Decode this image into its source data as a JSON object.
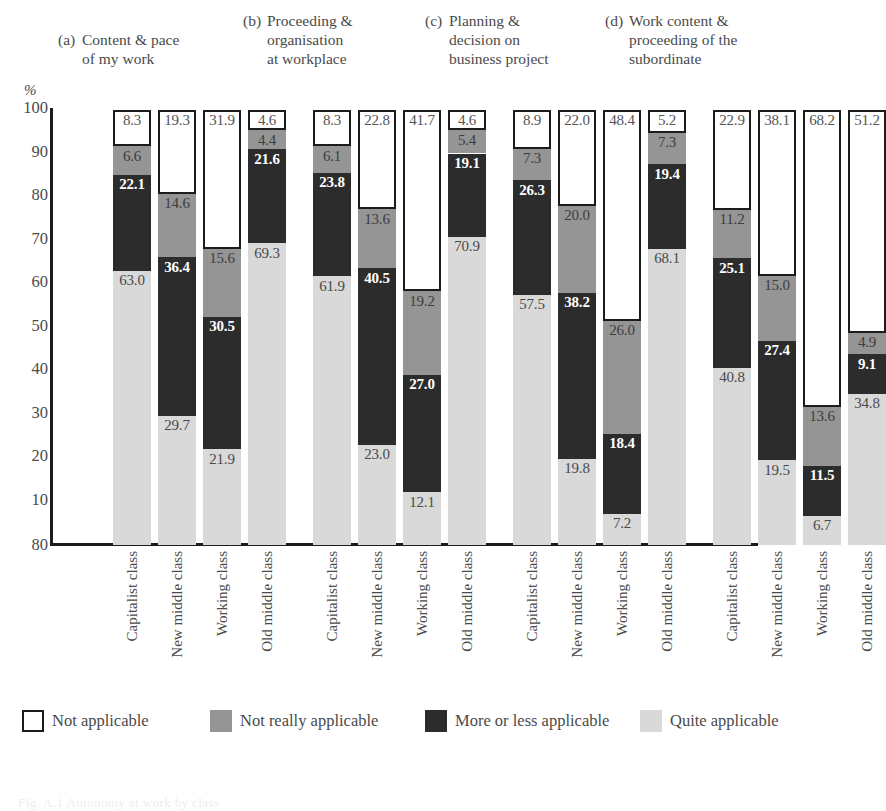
{
  "axis": {
    "unit_label": "%",
    "yticks": [
      "100",
      "90",
      "80",
      "70",
      "60",
      "50",
      "40",
      "30",
      "20",
      "10",
      "80"
    ]
  },
  "captions": [
    {
      "tag": "(a)",
      "text": "Content & pace\nof my work"
    },
    {
      "tag": "(b)",
      "text": "Proceeding &\norganisation\nat workplace"
    },
    {
      "tag": "(c)",
      "text": "Planning &\ndecision on\nbusiness project"
    },
    {
      "tag": "(d)",
      "text": "Work content &\nproceeding of the\nsubordinate"
    }
  ],
  "categories": [
    "Capitalist class",
    "New middle class",
    "Working class",
    "Old middle class"
  ],
  "legend": [
    {
      "label": "Not applicable",
      "color": "#ffffff",
      "key": "not_applicable"
    },
    {
      "label": "Not really applicable",
      "color": "#959595",
      "key": "not_really_applicable"
    },
    {
      "label": "More or less applicable",
      "color": "#2c2c2c",
      "key": "more_or_less_applicable"
    },
    {
      "label": "Quite applicable",
      "color": "#d9d9d9",
      "key": "quite_applicable"
    }
  ],
  "footer_clipped": "Fig. A.1  Autonomy at work by class",
  "chart_data": {
    "type": "bar",
    "subtype": "stacked-100-percent",
    "title": "",
    "xlabel": "",
    "ylabel": "%",
    "ylim": [
      0,
      100
    ],
    "grid": false,
    "legend_position": "bottom",
    "categories": [
      "Capitalist class",
      "New middle class",
      "Working class",
      "Old middle class"
    ],
    "series": [
      {
        "name": "Quite applicable",
        "color": "#d9d9d9"
      },
      {
        "name": "More or less applicable",
        "color": "#2c2c2c"
      },
      {
        "name": "Not really applicable",
        "color": "#959595"
      },
      {
        "name": "Not applicable",
        "color": "#ffffff"
      }
    ],
    "panels": [
      {
        "tag": "(a)",
        "title": "Content & pace of my work",
        "bars": [
          {
            "category": "Capitalist class",
            "quite_applicable": 63.0,
            "more_or_less_applicable": 22.1,
            "not_really_applicable": 6.6,
            "not_applicable": 8.3
          },
          {
            "category": "New middle class",
            "quite_applicable": 29.7,
            "more_or_less_applicable": 36.4,
            "not_really_applicable": 14.6,
            "not_applicable": 19.3
          },
          {
            "category": "Working class",
            "quite_applicable": 21.9,
            "more_or_less_applicable": 30.5,
            "not_really_applicable": 15.6,
            "not_applicable": 31.9
          },
          {
            "category": "Old middle class",
            "quite_applicable": 69.3,
            "more_or_less_applicable": 21.6,
            "not_really_applicable": 4.4,
            "not_applicable": 4.6
          }
        ]
      },
      {
        "tag": "(b)",
        "title": "Proceeding & organisation at workplace",
        "bars": [
          {
            "category": "Capitalist class",
            "quite_applicable": 61.9,
            "more_or_less_applicable": 23.8,
            "not_really_applicable": 6.1,
            "not_applicable": 8.3
          },
          {
            "category": "New middle class",
            "quite_applicable": 23.0,
            "more_or_less_applicable": 40.5,
            "not_really_applicable": 13.6,
            "not_applicable": 22.8
          },
          {
            "category": "Working class",
            "quite_applicable": 12.1,
            "more_or_less_applicable": 27.0,
            "not_really_applicable": 19.2,
            "not_applicable": 41.7
          },
          {
            "category": "Old middle class",
            "quite_applicable": 70.9,
            "more_or_less_applicable": 19.1,
            "not_really_applicable": 5.4,
            "not_applicable": 4.6
          }
        ]
      },
      {
        "tag": "(c)",
        "title": "Planning & decision on business project",
        "bars": [
          {
            "category": "Capitalist class",
            "quite_applicable": 57.5,
            "more_or_less_applicable": 26.3,
            "not_really_applicable": 7.3,
            "not_applicable": 8.9
          },
          {
            "category": "New middle class",
            "quite_applicable": 19.8,
            "more_or_less_applicable": 38.2,
            "not_really_applicable": 20.0,
            "not_applicable": 22.0
          },
          {
            "category": "Working class",
            "quite_applicable": 7.2,
            "more_or_less_applicable": 18.4,
            "not_really_applicable": 26.0,
            "not_applicable": 48.4
          },
          {
            "category": "Old middle class",
            "quite_applicable": 68.1,
            "more_or_less_applicable": 19.4,
            "not_really_applicable": 7.3,
            "not_applicable": 5.2
          }
        ]
      },
      {
        "tag": "(d)",
        "title": "Work content & proceeding of the subordinate",
        "bars": [
          {
            "category": "Capitalist class",
            "quite_applicable": 40.8,
            "more_or_less_applicable": 25.1,
            "not_really_applicable": 11.2,
            "not_applicable": 22.9
          },
          {
            "category": "New middle class",
            "quite_applicable": 19.5,
            "more_or_less_applicable": 27.4,
            "not_really_applicable": 15.0,
            "not_applicable": 38.1
          },
          {
            "category": "Working class",
            "quite_applicable": 6.7,
            "more_or_less_applicable": 11.5,
            "not_really_applicable": 13.6,
            "not_applicable": 68.2
          },
          {
            "category": "Old middle class",
            "quite_applicable": 34.8,
            "more_or_less_applicable": 9.1,
            "not_really_applicable": 4.9,
            "not_applicable": 51.2
          }
        ]
      }
    ]
  }
}
